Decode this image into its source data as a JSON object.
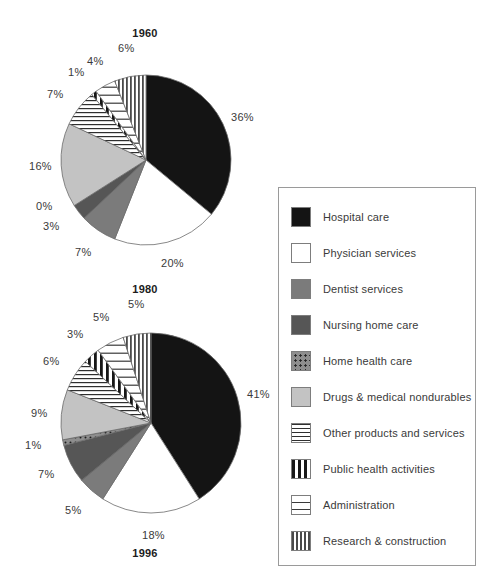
{
  "chart_data": [
    {
      "type": "pie",
      "title": "1960",
      "categories": [
        "Hospital care",
        "Physician services",
        "Dentist services",
        "Nursing home care",
        "Home health care",
        "Drugs & medical nondurables",
        "Other products and services",
        "Public health activities",
        "Administration",
        "Research & construction"
      ],
      "values": [
        36,
        20,
        7,
        3,
        0,
        16,
        7,
        1,
        4,
        6
      ],
      "labels": [
        "36%",
        "20%",
        "7%",
        "3%",
        "0%",
        "16%",
        "7%",
        "1%",
        "4%",
        "6%"
      ],
      "xlabel": "",
      "ylabel": "",
      "grid": false,
      "legend_position": "right"
    },
    {
      "type": "pie",
      "title": "1980",
      "categories": [
        "Hospital care",
        "Physician services",
        "Dentist services",
        "Nursing home care",
        "Home health care",
        "Drugs & medical nondurables",
        "Other products and services",
        "Public health activities",
        "Administration",
        "Research & construction"
      ],
      "values": [
        41,
        18,
        5,
        7,
        1,
        9,
        6,
        3,
        5,
        5
      ],
      "labels": [
        "41%",
        "18%",
        "5%",
        "7%",
        "1%",
        "9%",
        "6%",
        "3%",
        "5%",
        "5%"
      ],
      "xlabel": "",
      "ylabel": "",
      "grid": false,
      "legend_position": "right"
    }
  ],
  "charts": [
    {
      "title": "1960",
      "slices": [
        {
          "label": "36%",
          "value": 36,
          "category": "Hospital care",
          "fill": "solid-black"
        },
        {
          "label": "20%",
          "value": 20,
          "category": "Physician services",
          "fill": "white"
        },
        {
          "label": "7%",
          "value": 7,
          "category": "Dentist services",
          "fill": "gray-med"
        },
        {
          "label": "3%",
          "value": 3,
          "category": "Nursing home care",
          "fill": "gray-dark"
        },
        {
          "label": "0%",
          "value": 0,
          "category": "Home health care",
          "fill": "dots"
        },
        {
          "label": "16%",
          "value": 16,
          "category": "Drugs & medical nondurables",
          "fill": "gray-light"
        },
        {
          "label": "7%",
          "value": 7,
          "category": "Other products and services",
          "fill": "hlines"
        },
        {
          "label": "1%",
          "value": 1,
          "category": "Public health activities",
          "fill": "vbars"
        },
        {
          "label": "4%",
          "value": 4,
          "category": "Administration",
          "fill": "hband"
        },
        {
          "label": "6%",
          "value": 6,
          "category": "Research & construction",
          "fill": "vthin"
        }
      ]
    },
    {
      "title": "1980",
      "slices": [
        {
          "label": "41%",
          "value": 41,
          "category": "Hospital care",
          "fill": "solid-black"
        },
        {
          "label": "18%",
          "value": 18,
          "category": "Physician services",
          "fill": "white"
        },
        {
          "label": "5%",
          "value": 5,
          "category": "Dentist services",
          "fill": "gray-med"
        },
        {
          "label": "7%",
          "value": 7,
          "category": "Nursing home care",
          "fill": "gray-dark"
        },
        {
          "label": "1%",
          "value": 1,
          "category": "Home health care",
          "fill": "dots"
        },
        {
          "label": "9%",
          "value": 9,
          "category": "Drugs & medical nondurables",
          "fill": "gray-light"
        },
        {
          "label": "6%",
          "value": 6,
          "category": "Other products and services",
          "fill": "hlines"
        },
        {
          "label": "3%",
          "value": 3,
          "category": "Public health activities",
          "fill": "vbars"
        },
        {
          "label": "5%",
          "value": 5,
          "category": "Administration",
          "fill": "hband"
        },
        {
          "label": "5%",
          "value": 5,
          "category": "Research & construction",
          "fill": "vthin"
        }
      ]
    }
  ],
  "titles": {
    "chart1": "1960",
    "chart2": "1980",
    "chart3": "1996"
  },
  "legend": {
    "items": [
      {
        "label": "Hospital care",
        "fill": "solid-black"
      },
      {
        "label": "Physician services",
        "fill": "white"
      },
      {
        "label": "Dentist services",
        "fill": "gray-med"
      },
      {
        "label": "Nursing home care",
        "fill": "gray-dark"
      },
      {
        "label": "Home health care",
        "fill": "dots"
      },
      {
        "label": "Drugs & medical nondurables",
        "fill": "gray-light"
      },
      {
        "label": "Other products and services",
        "fill": "hlines"
      },
      {
        "label": "Public health activities",
        "fill": "vbars"
      },
      {
        "label": "Administration",
        "fill": "hband"
      },
      {
        "label": "Research & construction",
        "fill": "vthin"
      }
    ]
  },
  "colors": {
    "solid_black": "#141414",
    "white": "#ffffff",
    "gray_med": "#7b7b7b",
    "gray_dark": "#565656",
    "gray_light": "#c3c3c3",
    "outline": "#6b6b6b",
    "text": "#3a3a3a"
  }
}
